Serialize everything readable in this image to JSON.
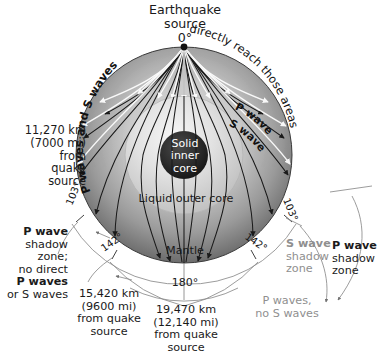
{
  "title": {
    "line1": "Earthquake",
    "line2": "source",
    "line3": "0°"
  },
  "interior_labels": {
    "inner_core_l1": "Solid",
    "inner_core_l2": "inner",
    "inner_core_l3": "core",
    "outer_core": "Liquid outer core",
    "mantle": "Mantle"
  },
  "curved_labels": {
    "left_top": "P waves and S waves",
    "right_top": "directly reach those areas",
    "p_wave": "P wave",
    "s_wave": "S wave"
  },
  "angles": {
    "zero": "0°",
    "left_103": "103°",
    "right_103": "103°",
    "left_142": "142°",
    "right_142": "142°",
    "bottom_180": "180°"
  },
  "distance_labels": {
    "upper_left": {
      "l1": "11,270 km",
      "l2": "(7000 mi)",
      "l3": "from",
      "l4": "quake",
      "l5": "source"
    },
    "lower_left": {
      "l1": "15,420 km",
      "l2": "(9600 mi)",
      "l3": "from quake",
      "l4": "source"
    },
    "bottom_center": {
      "l1": "19,470 km",
      "l2": "(12,140 mi)",
      "l3": "from quake",
      "l4": "source"
    }
  },
  "shadow_zones": {
    "left": {
      "l1": "P wave",
      "l2": "shadow",
      "l3": "zone;",
      "l4": "no direct",
      "l5": "P waves",
      "l6": "or S waves"
    },
    "s_zone": {
      "l1": "S wave",
      "l2": "shadow",
      "l3": "zone"
    },
    "p_zone": {
      "l1": "P wave",
      "l2": "shadow",
      "l3": "zone"
    },
    "p_only": {
      "l1": "P waves,",
      "l2": "no S waves"
    }
  },
  "colors": {
    "mantle_outer": "#6e6e6e",
    "mantle_inner": "#cfcfcf",
    "outer_core_edge": "#f1f1f1",
    "outer_core_fill": "#d6d6d6",
    "inner_core": "#262626",
    "ray_line": "#1a1a1a",
    "white_ray": "#ffffff",
    "gray_text": "#8f8f8f",
    "dim_line": "#8a8a8a",
    "background": "#ffffff"
  },
  "geometry": {
    "center_x": 184,
    "center_y": 155,
    "earth_radius": 108,
    "outer_core_radius": 59,
    "inner_core_radius": 24,
    "source_x": 184,
    "source_y": 47
  }
}
